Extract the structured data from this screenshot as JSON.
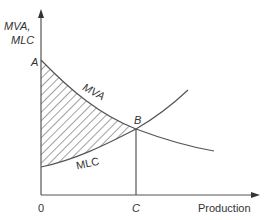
{
  "diagram": {
    "type": "economics-curve-diagram",
    "y_axis_label_line1": "MVA,",
    "y_axis_label_line2": "MLC",
    "x_axis_label": "Production",
    "origin_label": "0",
    "point_a_label": "A",
    "point_b_label": "B",
    "point_c_label": "C",
    "curve_mva_label": "MVA",
    "curve_mlc_label": "MLC",
    "shaded_region": "area between MVA and MLC from 0 to C",
    "colors": {
      "line": "#555555",
      "text": "#333333",
      "hatch": "#444444",
      "background": "#ffffff"
    }
  }
}
